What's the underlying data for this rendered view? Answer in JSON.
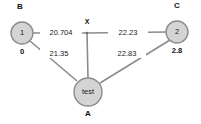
{
  "graph": {
    "background_color": "#ffffff",
    "node_fill_color": "#d4d4d4",
    "node_stroke_color": "#8c8c8c",
    "edge_color": "#8c8c8c",
    "text_color": "#111111",
    "nodes": [
      {
        "id": "node-1",
        "text": "1",
        "name_label": "B",
        "value_label": "0",
        "cx": 22,
        "cy": 33,
        "r": 11
      },
      {
        "id": "node-2",
        "text": "2",
        "name_label": "C",
        "value_label": "2.8",
        "cx": 177,
        "cy": 32,
        "r": 11
      },
      {
        "id": "node-test",
        "text": "test",
        "name_label": "A",
        "value_label": "",
        "cx": 88,
        "cy": 92,
        "r": 14
      }
    ],
    "junction": {
      "id": "junction-x",
      "label": "X",
      "cx": 87,
      "cy": 33
    },
    "edges": [
      {
        "id": "edge-b-x",
        "from": "node-1",
        "to": "junction-x",
        "weight": "20.704",
        "label_x": 60,
        "label_y": 33
      },
      {
        "id": "edge-x-c",
        "from": "junction-x",
        "to": "node-2",
        "weight": "22.23",
        "label_x": 127,
        "label_y": 33
      },
      {
        "id": "edge-b-a",
        "from": "node-1",
        "to": "node-test",
        "weight": "21.35",
        "label_x": 58,
        "label_y": 54
      },
      {
        "id": "edge-a-c",
        "from": "node-test",
        "to": "node-2",
        "weight": "22.83",
        "label_x": 126,
        "label_y": 54
      },
      {
        "id": "edge-x-a",
        "from": "junction-x",
        "to": "node-test",
        "weight": "",
        "label_x": 0,
        "label_y": 0
      }
    ]
  }
}
